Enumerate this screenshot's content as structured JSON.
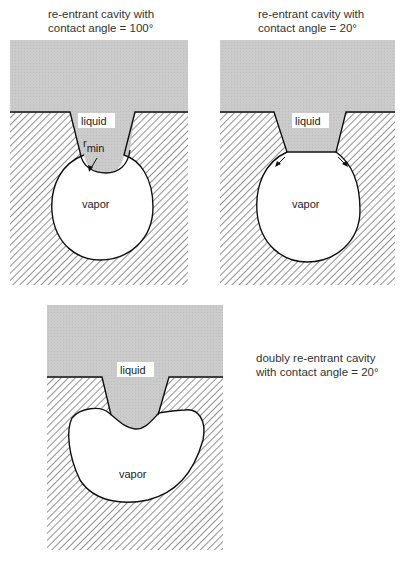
{
  "panels": [
    {
      "id": "panel-1",
      "caption_line1": "re-entrant cavity with",
      "caption_line2": "contact angle = 100°",
      "liquid_label": "liquid",
      "vapor_label": "vapor",
      "annotation": "r",
      "annotation_sub": "min"
    },
    {
      "id": "panel-2",
      "caption_line1": "re-entrant cavity with",
      "caption_line2": "contact angle = 20°",
      "liquid_label": "liquid",
      "vapor_label": "vapor"
    },
    {
      "id": "panel-3",
      "caption_line1": "doubly re-entrant cavity",
      "caption_line2": "with contact angle = 20°",
      "liquid_label": "liquid",
      "vapor_label": "vapor"
    }
  ],
  "colors": {
    "liquid": "#c8c8c8",
    "solid_hatch": "#555555",
    "outline": "#111111",
    "vapor": "#ffffff"
  }
}
